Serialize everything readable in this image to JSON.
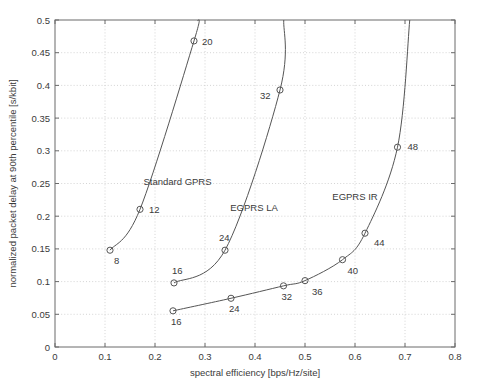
{
  "chart_data": {
    "type": "line",
    "title": "",
    "xlabel": "spectral efficiency [bps/Hz/site]",
    "ylabel": "normalized packet delay at 90th percentile [s/kbit]",
    "xlim": [
      0,
      0.8
    ],
    "ylim": [
      0,
      0.5
    ],
    "xticks": [
      0,
      0.1,
      0.2,
      0.3,
      0.4,
      0.5,
      0.6,
      0.7,
      0.8
    ],
    "xticklabels": [
      "0",
      "0.1",
      "0.2",
      "0.3",
      "0.4",
      "0.5",
      "0.6",
      "0.7",
      "0.8"
    ],
    "yticks": [
      0,
      0.05,
      0.1,
      0.15,
      0.2,
      0.25,
      0.3,
      0.35,
      0.4,
      0.45,
      0.5
    ],
    "yticklabels": [
      "0",
      "0.05",
      "0.1",
      "0.15",
      "0.2",
      "0.25",
      "0.3",
      "0.35",
      "0.4",
      "0.45",
      "0.5"
    ],
    "grid": true,
    "legend": "inline-annotations",
    "marker": "open-circle",
    "line_color": "#555555",
    "grid_color": "#c9c9c9",
    "axis_color": "#6b6b6b",
    "series": [
      {
        "name": "Standard GPRS",
        "label_x": 0.245,
        "label_y": 0.247,
        "points": [
          {
            "x": 0.11,
            "y": 0.148,
            "label": "8",
            "label_dx": 4,
            "label_dy": 14
          },
          {
            "x": 0.17,
            "y": 0.2105,
            "label": "12",
            "label_dx": 9,
            "label_dy": 4
          },
          {
            "x": 0.278,
            "y": 0.468,
            "label": "20",
            "label_dx": 8,
            "label_dy": 4
          }
        ],
        "extends_beyond_top": true,
        "top_exit_x": 0.2855
      },
      {
        "name": "EGPRS LA",
        "label_x": 0.398,
        "label_y": 0.2075,
        "points": [
          {
            "x": 0.238,
            "y": 0.098,
            "label": "16",
            "label_dx": -2,
            "label_dy": -9
          },
          {
            "x": 0.34,
            "y": 0.148,
            "label": "24",
            "label_dx": -6,
            "label_dy": -9
          },
          {
            "x": 0.45,
            "y": 0.393,
            "label": "32",
            "label_dx": -20,
            "label_dy": 9
          }
        ],
        "extends_beyond_top": true,
        "top_exit_x": 0.4575
      },
      {
        "name": "EGPRS IR",
        "label_x": 0.6,
        "label_y": 0.2255,
        "points": [
          {
            "x": 0.236,
            "y": 0.0553,
            "label": "16",
            "label_dx": -2,
            "label_dy": 14
          },
          {
            "x": 0.352,
            "y": 0.0745,
            "label": "24",
            "label_dx": -2,
            "label_dy": 14
          },
          {
            "x": 0.457,
            "y": 0.0935,
            "label": "32",
            "label_dx": -2,
            "label_dy": 14
          },
          {
            "x": 0.5,
            "y": 0.1015,
            "label": "36",
            "label_dx": 7,
            "label_dy": 14
          },
          {
            "x": 0.575,
            "y": 0.1335,
            "label": "40",
            "label_dx": 5,
            "label_dy": 14
          },
          {
            "x": 0.62,
            "y": 0.174,
            "label": "44",
            "label_dx": 9,
            "label_dy": 13
          },
          {
            "x": 0.685,
            "y": 0.3055,
            "label": "48",
            "label_dx": 10,
            "label_dy": 3
          }
        ],
        "extends_beyond_top": true,
        "top_exit_x": 0.7095
      }
    ]
  }
}
